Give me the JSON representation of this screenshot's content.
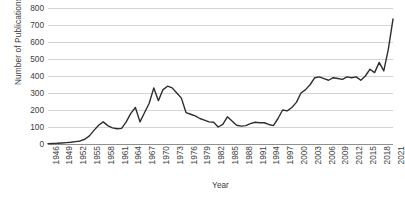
{
  "chart_data": {
    "type": "line",
    "title": "",
    "xlabel": "Year",
    "ylabel": "Number of Publications",
    "ylim": [
      0,
      800
    ],
    "xlim": [
      1946,
      2021
    ],
    "grid": true,
    "legend": "none",
    "line_color": "#2e2e2e",
    "grid_color": "#d4d4d4",
    "axis_color": "#8f8f8f",
    "y_ticks": [
      800,
      700,
      600,
      500,
      400,
      300,
      200,
      100,
      0
    ],
    "x_ticks": [
      "1946",
      "1949",
      "1952",
      "1955",
      "1958",
      "1961",
      "1964",
      "1967",
      "1970",
      "1973",
      "1976",
      "1979",
      "1982",
      "1985",
      "1988",
      "1991",
      "1994",
      "1997",
      "2000",
      "2003",
      "2006",
      "2009",
      "2012",
      "2015",
      "2018",
      "2021"
    ],
    "x": [
      1946,
      1947,
      1948,
      1949,
      1950,
      1951,
      1952,
      1953,
      1954,
      1955,
      1956,
      1957,
      1958,
      1959,
      1960,
      1961,
      1962,
      1963,
      1964,
      1965,
      1966,
      1967,
      1968,
      1969,
      1970,
      1971,
      1972,
      1973,
      1974,
      1975,
      1976,
      1977,
      1978,
      1979,
      1980,
      1981,
      1982,
      1983,
      1984,
      1985,
      1986,
      1987,
      1988,
      1989,
      1990,
      1991,
      1992,
      1993,
      1994,
      1995,
      1996,
      1997,
      1998,
      1999,
      2000,
      2001,
      2002,
      2003,
      2004,
      2005,
      2006,
      2007,
      2008,
      2009,
      2010,
      2011,
      2012,
      2013,
      2014,
      2015,
      2016,
      2017,
      2018,
      2019,
      2020,
      2021
    ],
    "values": [
      2,
      3,
      4,
      6,
      8,
      10,
      14,
      18,
      28,
      48,
      80,
      110,
      130,
      108,
      95,
      90,
      92,
      130,
      180,
      215,
      130,
      185,
      240,
      330,
      255,
      320,
      340,
      330,
      300,
      270,
      185,
      175,
      165,
      150,
      140,
      130,
      128,
      100,
      115,
      160,
      135,
      110,
      105,
      108,
      120,
      128,
      125,
      125,
      115,
      108,
      150,
      200,
      195,
      215,
      245,
      300,
      320,
      350,
      390,
      395,
      385,
      375,
      390,
      385,
      380,
      395,
      390,
      395,
      375,
      400,
      440,
      420,
      480,
      430,
      560,
      735
    ],
    "series_name": "Publications"
  }
}
